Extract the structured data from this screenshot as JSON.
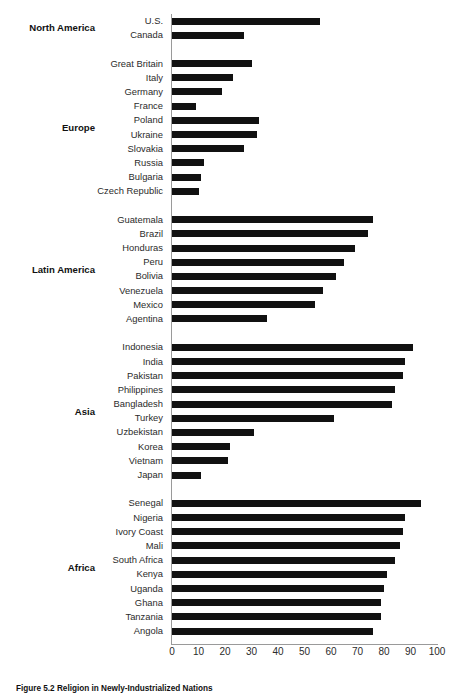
{
  "caption": "Figure 5.2  Religion in Newly-Industrialized Nations",
  "axis": {
    "ticks": [
      0,
      10,
      20,
      30,
      40,
      50,
      60,
      70,
      80,
      90,
      100
    ],
    "min": 0,
    "max": 100
  },
  "colors": {
    "bar": "#111111",
    "axis": "#9a9a9a",
    "label": "#2b2b2b",
    "group": "#111111"
  },
  "groups": [
    {
      "name": "North America",
      "items": [
        {
          "label": "U.S.",
          "value": 56
        },
        {
          "label": "Canada",
          "value": 27
        }
      ]
    },
    {
      "name": "Europe",
      "items": [
        {
          "label": "Great Britain",
          "value": 30
        },
        {
          "label": "Italy",
          "value": 23
        },
        {
          "label": "Germany",
          "value": 19
        },
        {
          "label": "France",
          "value": 9
        },
        {
          "label": "Poland",
          "value": 33
        },
        {
          "label": "Ukraine",
          "value": 32
        },
        {
          "label": "Slovakia",
          "value": 27
        },
        {
          "label": "Russia",
          "value": 12
        },
        {
          "label": "Bulgaria",
          "value": 11
        },
        {
          "label": "Czech Republic",
          "value": 10
        }
      ]
    },
    {
      "name": "Latin America",
      "items": [
        {
          "label": "Guatemala",
          "value": 76
        },
        {
          "label": "Brazil",
          "value": 74
        },
        {
          "label": "Honduras",
          "value": 69
        },
        {
          "label": "Peru",
          "value": 65
        },
        {
          "label": "Bolivia",
          "value": 62
        },
        {
          "label": "Venezuela",
          "value": 57
        },
        {
          "label": "Mexico",
          "value": 54
        },
        {
          "label": "Agentina",
          "value": 36
        }
      ]
    },
    {
      "name": "Asia",
      "items": [
        {
          "label": "Indonesia",
          "value": 91
        },
        {
          "label": "India",
          "value": 88
        },
        {
          "label": "Pakistan",
          "value": 87
        },
        {
          "label": "Philippines",
          "value": 84
        },
        {
          "label": "Bangladesh",
          "value": 83
        },
        {
          "label": "Turkey",
          "value": 61
        },
        {
          "label": "Uzbekistan",
          "value": 31
        },
        {
          "label": "Korea",
          "value": 22
        },
        {
          "label": "Vietnam",
          "value": 21
        },
        {
          "label": "Japan",
          "value": 11
        }
      ]
    },
    {
      "name": "Africa",
      "items": [
        {
          "label": "Senegal",
          "value": 94
        },
        {
          "label": "Nigeria",
          "value": 88
        },
        {
          "label": "Ivory Coast",
          "value": 87
        },
        {
          "label": "Mali",
          "value": 86
        },
        {
          "label": "South Africa",
          "value": 84
        },
        {
          "label": "Kenya",
          "value": 81
        },
        {
          "label": "Uganda",
          "value": 80
        },
        {
          "label": "Ghana",
          "value": 79
        },
        {
          "label": "Tanzania",
          "value": 79
        },
        {
          "label": "Angola",
          "value": 76
        }
      ]
    }
  ],
  "chart_data": {
    "type": "bar",
    "orientation": "horizontal",
    "title": "Figure 5.2  Religion in Newly-Industrialized Nations",
    "xlabel": "",
    "ylabel": "",
    "xlim": [
      0,
      100
    ],
    "xticks": [
      0,
      10,
      20,
      30,
      40,
      50,
      60,
      70,
      80,
      90,
      100
    ],
    "grid": false,
    "legend": "none",
    "group_labels": [
      "North America",
      "Europe",
      "Latin America",
      "Asia",
      "Africa"
    ],
    "categories": [
      "U.S.",
      "Canada",
      "Great Britain",
      "Italy",
      "Germany",
      "France",
      "Poland",
      "Ukraine",
      "Slovakia",
      "Russia",
      "Bulgaria",
      "Czech Republic",
      "Guatemala",
      "Brazil",
      "Honduras",
      "Peru",
      "Bolivia",
      "Venezuela",
      "Mexico",
      "Agentina",
      "Indonesia",
      "India",
      "Pakistan",
      "Philippines",
      "Bangladesh",
      "Turkey",
      "Uzbekistan",
      "Korea",
      "Vietnam",
      "Japan",
      "Senegal",
      "Nigeria",
      "Ivory Coast",
      "Mali",
      "South Africa",
      "Kenya",
      "Uganda",
      "Ghana",
      "Tanzania",
      "Angola"
    ],
    "values": [
      56,
      27,
      30,
      23,
      19,
      9,
      33,
      32,
      27,
      12,
      11,
      10,
      76,
      74,
      69,
      65,
      62,
      57,
      54,
      36,
      91,
      88,
      87,
      84,
      83,
      61,
      31,
      22,
      21,
      11,
      94,
      88,
      87,
      86,
      84,
      81,
      80,
      79,
      79,
      76
    ]
  }
}
